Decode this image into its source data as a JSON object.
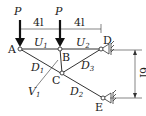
{
  "diagram": {
    "type": "truss",
    "colors": {
      "line": "#333333",
      "bg": "#ffffff"
    },
    "loads": [
      {
        "label": "P",
        "node": "A"
      },
      {
        "label": "P",
        "node": "B"
      }
    ],
    "dimensions": {
      "span_AB": "4l",
      "span_BD": "4l",
      "height_DE": "6l"
    },
    "nodes": {
      "A": "A",
      "B": "B",
      "C": "C",
      "D": "D",
      "E": "E"
    },
    "members": {
      "U1": {
        "name": "U",
        "sub": "1"
      },
      "U2": {
        "name": "U",
        "sub": "2"
      },
      "D1": {
        "name": "D",
        "sub": "1"
      },
      "D2": {
        "name": "D",
        "sub": "2"
      },
      "D3": {
        "name": "D",
        "sub": "3"
      },
      "V1": {
        "name": "V",
        "sub": "1"
      }
    }
  }
}
